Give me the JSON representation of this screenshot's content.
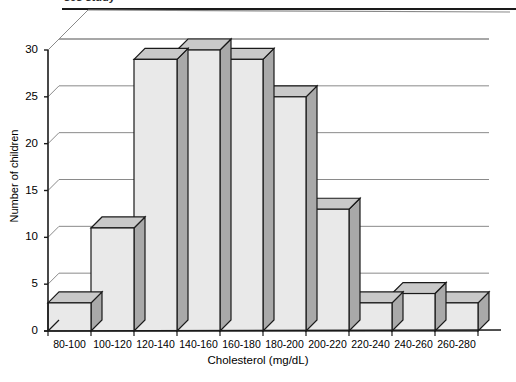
{
  "figure": {
    "caption_sliver": "ses study",
    "rule_color": "#1a1a1a"
  },
  "colors": {
    "bar_front": "#e9e9e9",
    "bar_top": "#c9c9c9",
    "bar_side": "#a9a9a9",
    "bar_outline": "#1a1a1a",
    "gridline": "#8a8a8a",
    "axis": "#1a1a1a",
    "text": "#000000"
  },
  "chart_data": {
    "type": "bar",
    "title": "",
    "xlabel": "Cholesterol (mg/dL)",
    "ylabel": "Number of children",
    "categories": [
      "80-100",
      "100-120",
      "120-140",
      "140-160",
      "160-180",
      "180-200",
      "200-220",
      "220-240",
      "240-260",
      "260-280"
    ],
    "values": [
      3,
      11,
      29,
      30,
      29,
      25,
      13,
      3,
      4,
      3
    ],
    "ylim": [
      0,
      30
    ],
    "yticks": [
      0,
      5,
      10,
      15,
      20,
      25,
      30
    ],
    "ytick_labels": [
      "0",
      "5",
      "10",
      "15",
      "20",
      "25",
      "30"
    ],
    "grid": true,
    "grid_axis": "y",
    "legend": null,
    "style": "3d-isometric-bars"
  }
}
